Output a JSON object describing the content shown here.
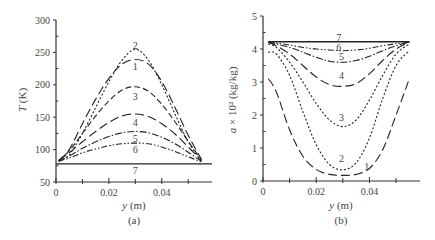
{
  "chart_data": [
    {
      "panel": "(a)",
      "type": "line",
      "title": "",
      "xlabel": "y (m)",
      "ylabel": "T (K)",
      "xlim": [
        0,
        0.059
      ],
      "ylim": [
        50,
        300
      ],
      "xticks": [
        0,
        0.02,
        0.04
      ],
      "xtick_labels": [
        "0",
        "0.02",
        "0.04"
      ],
      "yticks": [
        50,
        100,
        150,
        200,
        250,
        300
      ],
      "ytick_labels": [
        "50",
        "100",
        "150",
        "200",
        "250",
        "300"
      ],
      "grid": false,
      "legend": "inline curve labels 1-7",
      "series": [
        {
          "name": "1",
          "dash": "long-dash",
          "label_pos": [
            0.03,
            229
          ],
          "x": [
            0.001,
            0.005,
            0.01,
            0.015,
            0.02,
            0.025,
            0.03,
            0.035,
            0.04,
            0.045,
            0.05,
            0.055
          ],
          "y": [
            83,
            100,
            140,
            178,
            210,
            232,
            239,
            232,
            205,
            165,
            122,
            85
          ]
        },
        {
          "name": "2",
          "dash": "short-dot",
          "label_pos": [
            0.03,
            262
          ],
          "x": [
            0.001,
            0.005,
            0.01,
            0.015,
            0.02,
            0.025,
            0.03,
            0.035,
            0.04,
            0.045,
            0.05,
            0.055
          ],
          "y": [
            83,
            92,
            125,
            165,
            205,
            238,
            255,
            238,
            200,
            155,
            112,
            82
          ]
        },
        {
          "name": "3",
          "dash": "dash",
          "label_pos": [
            0.03,
            183
          ],
          "x": [
            0.001,
            0.005,
            0.01,
            0.015,
            0.02,
            0.025,
            0.03,
            0.035,
            0.04,
            0.045,
            0.05,
            0.055
          ],
          "y": [
            83,
            98,
            125,
            152,
            175,
            192,
            197,
            190,
            170,
            143,
            113,
            84
          ]
        },
        {
          "name": "4",
          "dash": "long-dash",
          "label_pos": [
            0.03,
            143
          ],
          "x": [
            0.001,
            0.005,
            0.01,
            0.015,
            0.02,
            0.025,
            0.03,
            0.035,
            0.04,
            0.045,
            0.05,
            0.055
          ],
          "y": [
            83,
            95,
            112,
            128,
            142,
            152,
            155,
            151,
            140,
            124,
            104,
            83
          ]
        },
        {
          "name": "5",
          "dash": "dash-dot",
          "label_pos": [
            0.03,
            118
          ],
          "x": [
            0.001,
            0.005,
            0.01,
            0.015,
            0.02,
            0.025,
            0.03,
            0.035,
            0.04,
            0.045,
            0.05,
            0.055
          ],
          "y": [
            82,
            90,
            102,
            112,
            120,
            126,
            128,
            126,
            119,
            109,
            96,
            82
          ]
        },
        {
          "name": "6",
          "dash": "dash-dot-dot",
          "label_pos": [
            0.03,
            101
          ],
          "x": [
            0.001,
            0.005,
            0.01,
            0.015,
            0.02,
            0.025,
            0.03,
            0.035,
            0.04,
            0.045,
            0.05,
            0.055
          ],
          "y": [
            82,
            87,
            95,
            101,
            106,
            109,
            110,
            109,
            104,
            97,
            89,
            81
          ]
        },
        {
          "name": "7",
          "dash": "solid",
          "label_pos": [
            0.03,
            68
          ],
          "x": [
            0.0,
            0.059
          ],
          "y": [
            78,
            78
          ]
        }
      ],
      "caption": "(a)"
    },
    {
      "panel": "(b)",
      "type": "line",
      "title": "",
      "xlabel": "y (m)",
      "ylabel": "a × 10² (kg/kg)",
      "xlim": [
        0,
        0.059
      ],
      "ylim": [
        0,
        5
      ],
      "xticks": [
        0,
        0.02,
        0.04
      ],
      "xtick_labels": [
        "0",
        "0.02",
        "0.04"
      ],
      "yticks": [
        0,
        1,
        2,
        3,
        4,
        5
      ],
      "ytick_labels": [
        "0",
        "1",
        "2",
        "3",
        "4",
        "5"
      ],
      "grid": false,
      "legend": "inline curve labels 1-7",
      "series": [
        {
          "name": "1",
          "dash": "long-dash",
          "label_pos": [
            0.039,
            0.45
          ],
          "x": [
            0.002,
            0.005,
            0.01,
            0.015,
            0.02,
            0.025,
            0.03,
            0.035,
            0.04,
            0.045,
            0.05,
            0.055
          ],
          "y": [
            3.1,
            2.7,
            1.55,
            0.75,
            0.35,
            0.2,
            0.17,
            0.2,
            0.38,
            0.95,
            2.0,
            3.1
          ]
        },
        {
          "name": "2",
          "dash": "short-dot",
          "label_pos": [
            0.0295,
            0.7
          ],
          "x": [
            0.002,
            0.005,
            0.01,
            0.015,
            0.02,
            0.025,
            0.03,
            0.035,
            0.04,
            0.045,
            0.05,
            0.055
          ],
          "y": [
            3.9,
            3.85,
            3.2,
            2.1,
            1.1,
            0.5,
            0.34,
            0.55,
            1.3,
            2.5,
            3.5,
            3.95
          ]
        },
        {
          "name": "3",
          "dash": "short-dot",
          "label_pos": [
            0.0295,
            1.95
          ],
          "x": [
            0.002,
            0.005,
            0.01,
            0.015,
            0.02,
            0.025,
            0.03,
            0.035,
            0.04,
            0.045,
            0.05,
            0.055
          ],
          "y": [
            4.15,
            4.05,
            3.6,
            3.0,
            2.35,
            1.85,
            1.65,
            1.85,
            2.45,
            3.2,
            3.85,
            4.15
          ]
        },
        {
          "name": "4",
          "dash": "long-dash",
          "label_pos": [
            0.0295,
            3.2
          ],
          "x": [
            0.002,
            0.005,
            0.01,
            0.015,
            0.02,
            0.025,
            0.03,
            0.035,
            0.04,
            0.045,
            0.05,
            0.055
          ],
          "y": [
            4.2,
            4.1,
            3.85,
            3.5,
            3.15,
            2.92,
            2.87,
            2.95,
            3.25,
            3.65,
            4.0,
            4.2
          ]
        },
        {
          "name": "5",
          "dash": "dash-dot",
          "label_pos": [
            0.0295,
            3.78
          ],
          "x": [
            0.002,
            0.005,
            0.01,
            0.015,
            0.02,
            0.025,
            0.03,
            0.035,
            0.04,
            0.045,
            0.05,
            0.055
          ],
          "y": [
            4.2,
            4.15,
            4.05,
            3.9,
            3.75,
            3.63,
            3.6,
            3.65,
            3.78,
            3.95,
            4.1,
            4.2
          ]
        },
        {
          "name": "6",
          "dash": "dash-dot-dot",
          "label_pos": [
            0.0285,
            4.05
          ],
          "x": [
            0.002,
            0.005,
            0.01,
            0.015,
            0.02,
            0.025,
            0.03,
            0.035,
            0.04,
            0.045,
            0.05,
            0.055
          ],
          "y": [
            4.2,
            4.18,
            4.12,
            4.05,
            4.0,
            3.97,
            3.95,
            3.97,
            4.02,
            4.1,
            4.16,
            4.2
          ]
        },
        {
          "name": "7",
          "dash": "solid",
          "label_pos": [
            0.0285,
            4.38
          ],
          "x": [
            0.002,
            0.055
          ],
          "y": [
            4.22,
            4.22
          ]
        }
      ],
      "caption": "(b)"
    }
  ],
  "panels": [
    {
      "ylabel_italic": "T",
      "ylabel_rest": " (K)",
      "xlabel_italic": "y",
      "xlabel_rest": " (m)",
      "caption": "(a)"
    },
    {
      "ylabel_italic": "a",
      "ylabel_rest": " × 10² (kg/kg)",
      "xlabel_italic": "y",
      "xlabel_rest": " (m)",
      "caption": "(b)"
    }
  ],
  "style": {
    "axis_color": "#333333",
    "line_color": "#222222",
    "text_color": "#444444"
  }
}
